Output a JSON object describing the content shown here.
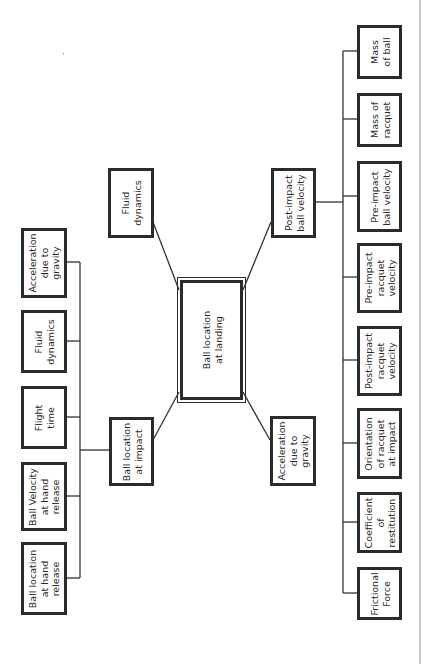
{
  "diagram": {
    "center": {
      "label": "Ball location\nat landing"
    },
    "top_branch": {
      "label": "Fluid\ndynamics"
    },
    "impact_node": {
      "label": "Ball location\nat impact",
      "children": [
        {
          "label": "Acceleration\ndue to\ngravity"
        },
        {
          "label": "Fluid\ndynamics"
        },
        {
          "label": "Flight\ntime"
        },
        {
          "label": "Ball Velocity\nat hand\nrelease"
        },
        {
          "label": "Ball location\nat hand\nrelease"
        }
      ]
    },
    "post_impact_node": {
      "label": "Post-impact\nball velocity",
      "children": [
        {
          "label": "Mass\nof ball"
        },
        {
          "label": "Mass of\nracquet"
        },
        {
          "label": "Pre-impact\nball velocity"
        },
        {
          "label": "Pre-impact\nracquet\nvelocity"
        },
        {
          "label": "Post-impact\nracquet\nvelocity"
        },
        {
          "label": "Orientation\nof racquet\nat impact"
        },
        {
          "label": "Coefficient\nof\nrestitution"
        },
        {
          "label": "Frictional\nForce"
        }
      ]
    },
    "gravity_branch": {
      "label": "Acceleration\ndue to\ngravity"
    }
  },
  "colors": {
    "line": "#2b2b2b",
    "border_rule": "#888888",
    "background": "#ffffff"
  }
}
